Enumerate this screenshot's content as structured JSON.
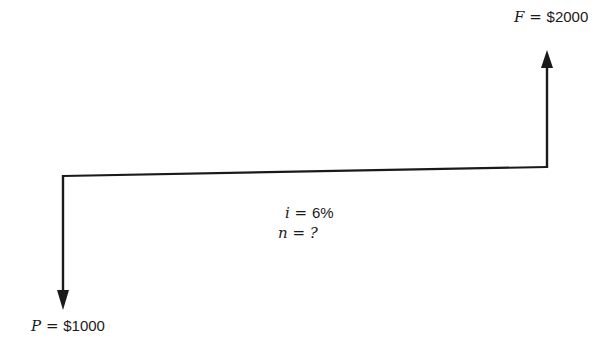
{
  "diagram": {
    "type": "cash-flow-diagram",
    "future_value": {
      "symbol": "F",
      "equals": "=",
      "value": "$2000"
    },
    "present_value": {
      "symbol": "P",
      "equals": "=",
      "value": "$1000"
    },
    "interest": {
      "symbol": "i",
      "equals": "=",
      "value": "6%"
    },
    "periods": {
      "symbol": "n",
      "equals": "=",
      "value": "?"
    },
    "line_color": "#1a1a1a"
  }
}
